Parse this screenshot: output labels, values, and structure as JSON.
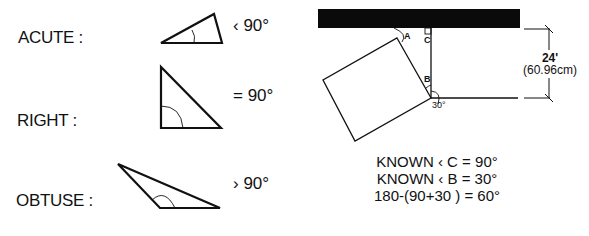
{
  "triangles": [
    {
      "label": "ACUTE :",
      "relation": "‹ 90°"
    },
    {
      "label": "RIGHT :",
      "relation": "= 90°"
    },
    {
      "label": "OBTUSE :",
      "relation": "› 90°"
    }
  ],
  "diagram": {
    "angle_labels": {
      "a": "A",
      "b": "B",
      "c": "C",
      "base": "30°"
    },
    "measurement": {
      "imperial": "24'",
      "metric": "(60.96cm)"
    },
    "known": [
      "KNOWN ‹ C = 90°",
      "KNOWN ‹ B = 30°",
      "180-(90+30 ) = 60°"
    ]
  }
}
